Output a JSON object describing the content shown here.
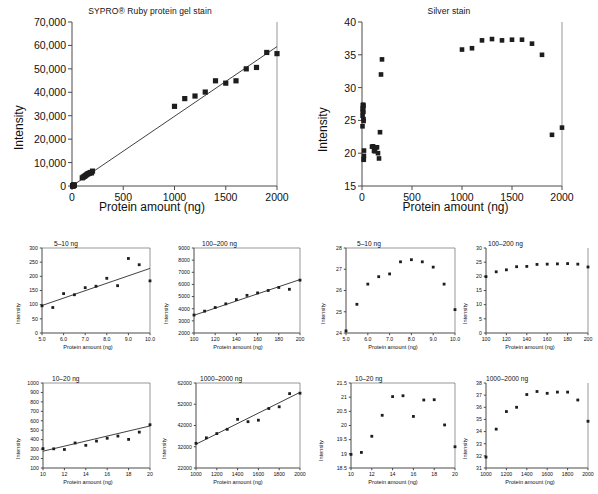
{
  "figure": {
    "name": "protein-stain-linearity-figure",
    "panel_count": 10
  },
  "chart_data": [
    {
      "id": "sypro-main",
      "type": "scatter",
      "title": "SYPRO® Ruby protein gel stain",
      "xlabel": "Protein amount (ng)",
      "ylabel": "Intensity",
      "xlim": [
        0,
        2000
      ],
      "ylim": [
        0,
        70000
      ],
      "xticks": [
        0,
        500,
        1000,
        1500,
        2000
      ],
      "xticklabels": [
        "0",
        "500",
        "1000",
        "1500",
        "2000"
      ],
      "yticks": [
        0,
        10000,
        20000,
        30000,
        40000,
        50000,
        60000,
        70000
      ],
      "yticklabels": [
        "0",
        "10,000",
        "20,000",
        "30,000",
        "40,000",
        "50,000",
        "60,000",
        "70,000"
      ],
      "grid": false,
      "legend": "none",
      "fit_line": {
        "x": [
          0,
          2000
        ],
        "y": [
          0,
          59500
        ]
      },
      "x": [
        5,
        6,
        7,
        8,
        9,
        10,
        11,
        12,
        13,
        14,
        15,
        16,
        17,
        18,
        19,
        20,
        100,
        110,
        120,
        130,
        140,
        150,
        160,
        170,
        180,
        190,
        200,
        1000,
        1100,
        1200,
        1300,
        1400,
        1500,
        1600,
        1700,
        1800,
        1900,
        2000
      ],
      "y": [
        96,
        90,
        139,
        135,
        160,
        165,
        193,
        167,
        263,
        241,
        184,
        300,
        305,
        296,
        365,
        340,
        3480,
        3800,
        4100,
        4400,
        4750,
        5100,
        5300,
        5500,
        5750,
        5600,
        6350,
        34000,
        37300,
        38400,
        40100,
        44900,
        43900,
        44900,
        50000,
        50600,
        57000,
        56500
      ]
    },
    {
      "id": "silver-main",
      "type": "scatter",
      "title": "Silver stain",
      "xlabel": "Protein amount (ng)",
      "ylabel": "Intensity",
      "xlim": [
        0,
        2000
      ],
      "ylim": [
        15,
        40
      ],
      "xticks": [
        0,
        500,
        1000,
        1500,
        2000
      ],
      "xticklabels": [
        "0",
        "500",
        "1000",
        "1500",
        "2000"
      ],
      "yticks": [
        15,
        20,
        25,
        30,
        35,
        40
      ],
      "yticklabels": [
        "15",
        "20",
        "25",
        "30",
        "35",
        "40"
      ],
      "grid": false,
      "legend": "none",
      "x": [
        5,
        6,
        7,
        8,
        9,
        10,
        11,
        12,
        13,
        14,
        15,
        16,
        17,
        18,
        19,
        20,
        100,
        110,
        120,
        130,
        140,
        150,
        160,
        170,
        180,
        190,
        200,
        1000,
        1100,
        1200,
        1300,
        1400,
        1500,
        1600,
        1700,
        1800,
        1900,
        2000
      ],
      "y": [
        24.1,
        25.7,
        26.3,
        26.7,
        26.9,
        27.3,
        27.4,
        27.3,
        27.1,
        26.3,
        25.2,
        24.9,
        19.0,
        19.1,
        19.6,
        20.4,
        21.0,
        21.05,
        20.35,
        20.3,
        20.9,
        20.9,
        20.0,
        19.2,
        23.2,
        32.0,
        34.3,
        35.8,
        36.0,
        37.2,
        37.4,
        37.2,
        37.3,
        37.3,
        36.7,
        35.0,
        22.8,
        23.9
      ]
    },
    {
      "id": "sypro-5-10",
      "type": "scatter",
      "inset_label": "5–10 ng",
      "xlabel": "Protein amount (ng)",
      "ylabel": "Intensity",
      "xlim": [
        5.0,
        10.0
      ],
      "ylim": [
        0,
        300
      ],
      "xticks": [
        5.0,
        6.0,
        7.0,
        8.0,
        9.0,
        10.0
      ],
      "xticklabels": [
        "5.0",
        "6.0",
        "7.0",
        "8.0",
        "9.0",
        "10.0"
      ],
      "yticks": [
        0,
        50,
        100,
        150,
        200,
        250,
        300
      ],
      "yticklabels": [
        "0",
        "50",
        "100",
        "150",
        "200",
        "250",
        "300"
      ],
      "fit_line": {
        "x": [
          5.0,
          10.0
        ],
        "y": [
          97,
          228
        ]
      },
      "x": [
        5.0,
        5.5,
        6.0,
        6.5,
        7.0,
        7.5,
        8.0,
        8.5,
        9.0,
        9.5,
        10.0
      ],
      "y": [
        96,
        90,
        139,
        135,
        160,
        165,
        193,
        167,
        263,
        241,
        184
      ]
    },
    {
      "id": "sypro-100-200",
      "type": "scatter",
      "inset_label": "100–200 ng",
      "xlabel": "Protein amount (ng)",
      "ylabel": "Intensity",
      "xlim": [
        100,
        200
      ],
      "ylim": [
        2000,
        9000
      ],
      "xticks": [
        100,
        120,
        140,
        160,
        180,
        200
      ],
      "xticklabels": [
        "100",
        "120",
        "140",
        "160",
        "180",
        "200"
      ],
      "yticks": [
        2000,
        3000,
        4000,
        5000,
        6000,
        7000,
        8000,
        9000
      ],
      "yticklabels": [
        "2000",
        "3000",
        "4000",
        "5000",
        "6000",
        "7000",
        "8000",
        "9000"
      ],
      "fit_line": {
        "x": [
          100,
          200
        ],
        "y": [
          3460,
          6400
        ]
      },
      "x": [
        100,
        110,
        120,
        130,
        140,
        150,
        160,
        170,
        180,
        190,
        200
      ],
      "y": [
        3480,
        3800,
        4100,
        4400,
        4750,
        5100,
        5300,
        5500,
        5750,
        5600,
        6350
      ]
    },
    {
      "id": "sypro-10-20",
      "type": "scatter",
      "inset_label": "10–20 ng",
      "xlabel": "Protein amount (ng)",
      "ylabel": "Intensity",
      "xlim": [
        10,
        20
      ],
      "ylim": [
        100,
        1000
      ],
      "xticks": [
        10,
        12,
        14,
        16,
        18,
        20
      ],
      "xticklabels": [
        "10",
        "12",
        "14",
        "16",
        "18",
        "20"
      ],
      "yticks": [
        100,
        200,
        300,
        400,
        500,
        600,
        700,
        800,
        900,
        1000
      ],
      "yticklabels": [
        "100",
        "200",
        "300",
        "400",
        "500",
        "600",
        "700",
        "800",
        "900",
        "1000"
      ],
      "fit_line": {
        "x": [
          10,
          20
        ],
        "y": [
          278,
          545
        ]
      },
      "x": [
        10,
        11,
        12,
        13,
        14,
        15,
        16,
        17,
        18,
        19,
        20
      ],
      "y": [
        305,
        303,
        296,
        365,
        340,
        385,
        415,
        438,
        403,
        480,
        558
      ]
    },
    {
      "id": "sypro-1000-2000",
      "type": "scatter",
      "inset_label": "1000–2000 ng",
      "xlabel": "Protein amount (ng)",
      "ylabel": "Intensity",
      "xlim": [
        1000,
        2000
      ],
      "ylim": [
        22000,
        62000
      ],
      "xticks": [
        1000,
        1200,
        1400,
        1600,
        1800,
        2000
      ],
      "xticklabels": [
        "1000",
        "1200",
        "1400",
        "1600",
        "1800",
        "2000"
      ],
      "yticks": [
        22000,
        32000,
        42000,
        52000,
        62000
      ],
      "yticklabels": [
        "22000",
        "32000",
        "42000",
        "52000",
        "62000"
      ],
      "fit_line": {
        "x": [
          1000,
          2000
        ],
        "y": [
          33200,
          57600
        ]
      },
      "x": [
        1000,
        1100,
        1200,
        1300,
        1400,
        1500,
        1600,
        1700,
        1800,
        1900,
        2000
      ],
      "y": [
        33600,
        36200,
        38200,
        40200,
        44900,
        43800,
        44500,
        50000,
        50800,
        57000,
        57200
      ]
    },
    {
      "id": "silver-5-10",
      "type": "scatter",
      "inset_label": "5–10 ng",
      "xlabel": "Protein amount (ng)",
      "ylabel": "Intensity",
      "xlim": [
        5.0,
        10.0
      ],
      "ylim": [
        24,
        28
      ],
      "xticks": [
        5.0,
        6.0,
        7.0,
        8.0,
        9.0,
        10.0
      ],
      "xticklabels": [
        "5.0",
        "6.0",
        "7.0",
        "8.0",
        "9.0",
        "10.0"
      ],
      "yticks": [
        24,
        25,
        26,
        27,
        28
      ],
      "yticklabels": [
        "24",
        "25",
        "26",
        "27",
        "28"
      ],
      "x": [
        5.0,
        5.5,
        6.0,
        6.5,
        7.0,
        7.5,
        8.0,
        8.5,
        9.0,
        9.5,
        10.0
      ],
      "y": [
        24.1,
        25.35,
        26.3,
        26.65,
        26.78,
        27.35,
        27.45,
        27.35,
        27.1,
        26.3,
        25.1
      ]
    },
    {
      "id": "silver-100-200",
      "type": "scatter",
      "inset_label": "100–200 ng",
      "xlabel": "Protein amount (ng)",
      "ylabel": "Intensity",
      "xlim": [
        100,
        200
      ],
      "ylim": [
        0,
        30
      ],
      "xticks": [
        100,
        120,
        140,
        160,
        180,
        200
      ],
      "xticklabels": [
        "100",
        "120",
        "140",
        "160",
        "180",
        "200"
      ],
      "yticks": [
        0,
        5,
        10,
        15,
        20,
        25,
        30
      ],
      "yticklabels": [
        "0",
        "5",
        "10",
        "15",
        "20",
        "25",
        "30"
      ],
      "x": [
        100,
        110,
        120,
        130,
        140,
        150,
        160,
        170,
        180,
        190,
        200
      ],
      "y": [
        19.9,
        21.6,
        22.3,
        23.4,
        23.5,
        24.2,
        24.3,
        24.4,
        24.5,
        24.3,
        23.3
      ]
    },
    {
      "id": "silver-10-20",
      "type": "scatter",
      "inset_label": "10–20 ng",
      "xlabel": "Protein amount (ng)",
      "ylabel": "Intensity",
      "xlim": [
        10,
        20
      ],
      "ylim": [
        18.5,
        21.5
      ],
      "xticks": [
        10,
        12,
        14,
        16,
        18,
        20
      ],
      "xticklabels": [
        "10",
        "12",
        "14",
        "16",
        "18",
        "20"
      ],
      "yticks": [
        18.5,
        19,
        19.5,
        20,
        20.5,
        21,
        21.5
      ],
      "yticklabels": [
        "18.5",
        "19",
        "19.5",
        "20",
        "20.5",
        "21",
        "21.5"
      ],
      "x": [
        10,
        11,
        12,
        13,
        14,
        15,
        16,
        17,
        18,
        19,
        20
      ],
      "y": [
        18.98,
        19.05,
        19.62,
        20.36,
        21.02,
        21.05,
        20.32,
        20.9,
        20.91,
        20.02,
        19.25
      ]
    },
    {
      "id": "silver-1000-2000",
      "type": "scatter",
      "inset_label": "1000–2000 ng",
      "xlabel": "Protein amount (ng)",
      "ylabel": "Intensity",
      "xlim": [
        1000,
        2000
      ],
      "ylim": [
        31,
        38
      ],
      "xticks": [
        1000,
        1200,
        1400,
        1600,
        1800,
        2000
      ],
      "xticklabels": [
        "1000",
        "1200",
        "1400",
        "1600",
        "1800",
        "2000"
      ],
      "yticks": [
        31,
        32,
        33,
        34,
        35,
        36,
        37,
        38
      ],
      "yticklabels": [
        "31",
        "32",
        "33",
        "34",
        "35",
        "36",
        "37",
        "38"
      ],
      "x": [
        1000,
        1100,
        1200,
        1300,
        1400,
        1500,
        1600,
        1700,
        1800,
        1900,
        2000
      ],
      "y": [
        31.9,
        34.2,
        35.65,
        36.0,
        37.05,
        37.3,
        37.15,
        37.25,
        37.25,
        36.6,
        34.85
      ]
    }
  ]
}
